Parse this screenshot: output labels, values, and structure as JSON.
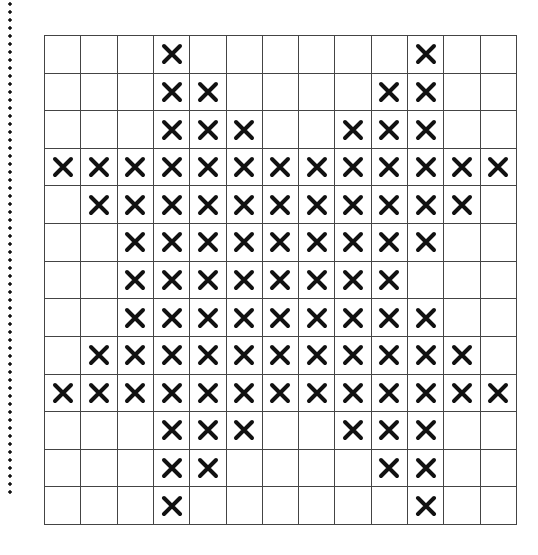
{
  "diagram": {
    "type": "cross-stitch-grid",
    "rows": 13,
    "cols": 13,
    "mark_symbol": "x-mark-icon",
    "mark_color": "#111111",
    "line_color": "#444444",
    "marked_cells": [
      [
        3,
        10
      ],
      [
        3,
        4,
        9,
        10
      ],
      [
        3,
        4,
        5,
        8,
        9,
        10
      ],
      [
        0,
        1,
        2,
        3,
        4,
        5,
        6,
        7,
        8,
        9,
        10,
        11,
        12
      ],
      [
        1,
        2,
        3,
        4,
        5,
        6,
        7,
        8,
        9,
        10,
        11
      ],
      [
        2,
        3,
        4,
        5,
        6,
        7,
        8,
        9,
        10
      ],
      [
        2,
        3,
        4,
        5,
        6,
        7,
        8,
        9
      ],
      [
        2,
        3,
        4,
        5,
        6,
        7,
        8,
        9,
        10
      ],
      [
        1,
        2,
        3,
        4,
        5,
        6,
        7,
        8,
        9,
        10,
        11
      ],
      [
        0,
        1,
        2,
        3,
        4,
        5,
        6,
        7,
        8,
        9,
        10,
        11,
        12
      ],
      [
        3,
        4,
        5,
        8,
        9,
        10
      ],
      [
        3,
        4,
        9,
        10
      ],
      [
        3,
        10
      ]
    ]
  },
  "margin": {
    "style": "dotted-vertical-line"
  }
}
